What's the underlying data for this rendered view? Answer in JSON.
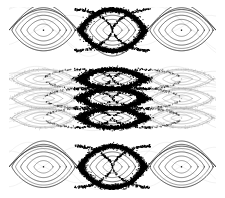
{
  "figure": {
    "title": "Poincare section phase portrait",
    "background_color": "#ffffff",
    "width": 225,
    "height": 198,
    "plot_area": {
      "x": 9,
      "y": 7,
      "width": 207,
      "height": 183
    }
  },
  "chart_data": {
    "type": "scatter",
    "title": "Poincare section phase portrait",
    "subtitle": "",
    "xlabel": "",
    "ylabel": "",
    "xlim": [
      0,
      3
    ],
    "ylim": [
      0,
      3
    ],
    "grid": false,
    "legend": false,
    "legend_position": "none",
    "colors": {
      "chaotic_layer": "#000000",
      "kam_curve": "#1a1a1a",
      "faded_structure": "#a8a8a8",
      "faint_structure": "#cfcfcf",
      "background": "#ffffff",
      "fixed_point": "#000000"
    },
    "island_centers_x": [
      0.5,
      1.5,
      2.5
    ],
    "island_centers_y": [
      0.38,
      1.18,
      1.5,
      1.82,
      2.62
    ],
    "series": [
      {
        "name": "chaotic separatrix layer",
        "color": "#000000",
        "point_count": 9000,
        "marker": "dot",
        "marker_size": 0.8
      },
      {
        "name": "regular KAM curves",
        "color": "#1a1a1a",
        "point_count": 2400,
        "marker": "line",
        "marker_size": 0.7
      },
      {
        "name": "faded background orbits",
        "color": "#a8a8a8",
        "point_count": 3000,
        "marker": "dot",
        "marker_size": 0.7
      }
    ],
    "annotations": [
      {
        "label": "elliptic fixed point",
        "count": 15
      },
      {
        "label": "hyperbolic X-point",
        "count": 12
      }
    ],
    "islands": [
      {
        "row": 0,
        "col": 0,
        "cx": 0.5,
        "cy": 2.62,
        "rx": 0.46,
        "ry": 0.34,
        "style": "dark",
        "chaotic": false,
        "clipped": true
      },
      {
        "row": 0,
        "col": 1,
        "cx": 1.5,
        "cy": 2.62,
        "rx": 0.46,
        "ry": 0.34,
        "style": "dark",
        "chaotic": true,
        "clipped": false
      },
      {
        "row": 0,
        "col": 2,
        "cx": 2.5,
        "cy": 2.62,
        "rx": 0.46,
        "ry": 0.34,
        "style": "dark",
        "chaotic": false,
        "clipped": true
      },
      {
        "row": 1,
        "col": 0,
        "cx": 0.5,
        "cy": 1.82,
        "rx": 0.46,
        "ry": 0.16,
        "style": "faded",
        "chaotic": false,
        "clipped": true
      },
      {
        "row": 1,
        "col": 1,
        "cx": 1.5,
        "cy": 1.82,
        "rx": 0.46,
        "ry": 0.16,
        "style": "dark",
        "chaotic": true,
        "clipped": false
      },
      {
        "row": 1,
        "col": 2,
        "cx": 2.5,
        "cy": 1.82,
        "rx": 0.46,
        "ry": 0.16,
        "style": "faded",
        "chaotic": false,
        "clipped": true
      },
      {
        "row": 2,
        "col": 0,
        "cx": 0.5,
        "cy": 1.5,
        "rx": 0.46,
        "ry": 0.16,
        "style": "faded",
        "chaotic": false,
        "clipped": true
      },
      {
        "row": 2,
        "col": 1,
        "cx": 1.5,
        "cy": 1.5,
        "rx": 0.46,
        "ry": 0.16,
        "style": "dark",
        "chaotic": true,
        "clipped": false
      },
      {
        "row": 2,
        "col": 2,
        "cx": 2.5,
        "cy": 1.5,
        "rx": 0.46,
        "ry": 0.16,
        "style": "faded",
        "chaotic": false,
        "clipped": true
      },
      {
        "row": 3,
        "col": 0,
        "cx": 0.5,
        "cy": 1.18,
        "rx": 0.46,
        "ry": 0.16,
        "style": "faded",
        "chaotic": false,
        "clipped": true
      },
      {
        "row": 3,
        "col": 1,
        "cx": 1.5,
        "cy": 1.18,
        "rx": 0.46,
        "ry": 0.16,
        "style": "dark",
        "chaotic": true,
        "clipped": false
      },
      {
        "row": 3,
        "col": 2,
        "cx": 2.5,
        "cy": 1.18,
        "rx": 0.46,
        "ry": 0.16,
        "style": "faded",
        "chaotic": false,
        "clipped": true
      },
      {
        "row": 4,
        "col": 0,
        "cx": 0.5,
        "cy": 0.38,
        "rx": 0.46,
        "ry": 0.34,
        "style": "dark",
        "chaotic": false,
        "clipped": true
      },
      {
        "row": 4,
        "col": 1,
        "cx": 1.5,
        "cy": 0.38,
        "rx": 0.46,
        "ry": 0.34,
        "style": "dark",
        "chaotic": true,
        "clipped": false
      },
      {
        "row": 4,
        "col": 2,
        "cx": 2.5,
        "cy": 0.38,
        "rx": 0.46,
        "ry": 0.34,
        "style": "dark",
        "chaotic": false,
        "clipped": true
      }
    ]
  }
}
